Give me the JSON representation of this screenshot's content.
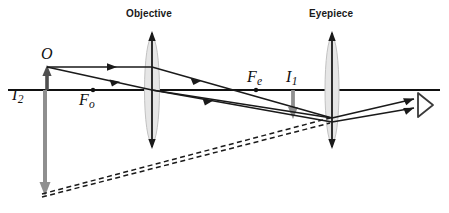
{
  "figure": {
    "type": "optical-ray-diagram",
    "background_color": "#ffffff"
  },
  "colors": {
    "ray": "#1a1a1a",
    "axis": "#111111",
    "lens_fill": "#e2e2e2",
    "lens_stroke": "#6f6f6f",
    "lens_axis": "#1a1a1a",
    "image_arrow": "#8a8a8a",
    "object_arrow": "#5a5a5a",
    "dashed": "#1a1a1a",
    "eye": "#3a3a3a",
    "label": "#111111",
    "lens_title": "#1a1a1a"
  },
  "lenses": [
    {
      "id": "objective",
      "label": "Objective",
      "x": 152,
      "label_x": 126,
      "label_y": 9
    },
    {
      "id": "eyepiece",
      "label": "Eyepiece",
      "x": 332,
      "label_x": 309,
      "label_y": 9
    }
  ],
  "point_labels": [
    {
      "id": "object",
      "text": "O",
      "sub": "",
      "x": 41,
      "y": 48,
      "size": 15
    },
    {
      "id": "final-image",
      "text": "I",
      "sub": "2",
      "x": 13,
      "y": 88,
      "size": 15
    },
    {
      "id": "objective-focus",
      "text": "F",
      "sub": "o",
      "x": 80,
      "y": 93,
      "size": 15
    },
    {
      "id": "eyepiece-focus",
      "text": "F",
      "sub": "e",
      "x": 248,
      "y": 70,
      "size": 15
    },
    {
      "id": "first-image",
      "text": "I",
      "sub": "1",
      "x": 286,
      "y": 70,
      "size": 15
    }
  ],
  "axis": {
    "y": 90,
    "x_start": 8,
    "x_end": 440
  },
  "focal_dots": [
    {
      "id": "objective-focal-point",
      "x": 93,
      "y": 90,
      "r": 2.1
    },
    {
      "id": "eyepiece-focal-point",
      "x": 256,
      "y": 90,
      "r": 2.1
    }
  ],
  "arrows": [
    {
      "id": "object-arrow",
      "x": 47,
      "y_from": 90,
      "y_to": 67,
      "color": "#5a5a5a",
      "width": 3.4,
      "direction": "up"
    },
    {
      "id": "image-1-arrow",
      "x": 293,
      "y_from": 90,
      "y_to": 117,
      "color": "#8a8a8a",
      "width": 3.4,
      "direction": "down"
    },
    {
      "id": "image-2-arrow",
      "x": 45,
      "y_from": 90,
      "y_to": 194,
      "color": "#8a8a8a",
      "width": 4.0,
      "direction": "down"
    }
  ],
  "rays": [
    {
      "id": "ray-1-parallel",
      "points": "47,67 152,67 332,118"
    },
    {
      "id": "ray-2-through-center",
      "points": "47,67 152,90 332,118"
    },
    {
      "id": "ray-3-lower",
      "points": "152,90 332,122"
    },
    {
      "id": "ray-out-upper",
      "points": "332,118 420,99"
    },
    {
      "id": "ray-out-lower",
      "points": "332,122 420,108"
    }
  ],
  "ray_arrowheads": [
    {
      "id": "ray-head-a",
      "x": 115,
      "y": 67,
      "angle": 0
    },
    {
      "id": "ray-head-b",
      "x": 118,
      "y": 81,
      "angle": 12.3
    },
    {
      "id": "ray-head-c",
      "x": 199,
      "y": 80,
      "angle": 15.8
    },
    {
      "id": "ray-head-d",
      "x": 212,
      "y": 100,
      "angle": 10.1
    },
    {
      "id": "ray-head-e",
      "x": 408,
      "y": 101,
      "angle": -12.2
    },
    {
      "id": "ray-head-f",
      "x": 408,
      "y": 110,
      "angle": -9.0
    }
  ],
  "dashed_lines": [
    {
      "id": "virtual-ray-upper",
      "points": "40,195 330,118"
    },
    {
      "id": "virtual-ray-lower",
      "points": "40,197 330,123"
    }
  ],
  "eye": {
    "id": "eye-symbol",
    "x": 416,
    "y": 104,
    "width": 16,
    "height": 21
  }
}
